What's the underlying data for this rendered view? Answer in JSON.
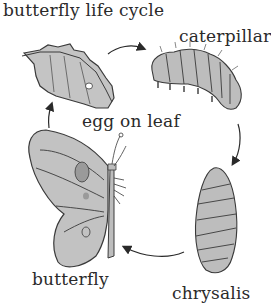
{
  "diagram": {
    "title": "butterfly life cycle",
    "stages": [
      {
        "id": "egg",
        "label": "egg on leaf",
        "icon": "leaf-with-egg-icon"
      },
      {
        "id": "caterpillar",
        "label": "caterpillar",
        "icon": "caterpillar-icon"
      },
      {
        "id": "chrysalis",
        "label": "chrysalis",
        "icon": "chrysalis-icon"
      },
      {
        "id": "butterfly",
        "label": "butterfly",
        "icon": "butterfly-icon"
      }
    ],
    "arrows": [
      {
        "from": "egg",
        "to": "caterpillar"
      },
      {
        "from": "caterpillar",
        "to": "chrysalis"
      },
      {
        "from": "chrysalis",
        "to": "butterfly"
      },
      {
        "from": "butterfly",
        "to": "egg"
      }
    ],
    "colors": {
      "fill": "#bdbdbd",
      "fill_light": "#d6d6d6",
      "outline": "#3a3a3a",
      "text": "#2a2a2a",
      "background": "#ffffff"
    }
  }
}
